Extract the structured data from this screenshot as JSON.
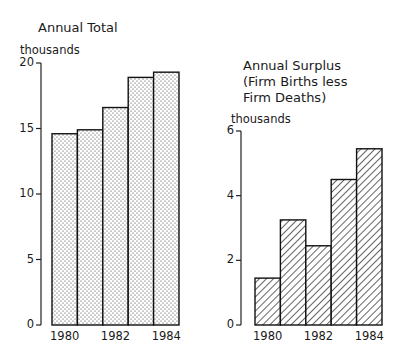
{
  "chart_data": [
    {
      "type": "bar",
      "title": "Annual Total",
      "ylabel": "thousands",
      "xlabel": "",
      "categories": [
        "1980",
        "1981",
        "1982",
        "1983",
        "1984"
      ],
      "values": [
        14.6,
        14.9,
        16.6,
        18.9,
        19.3
      ],
      "ylim": [
        0,
        20
      ],
      "yticks": [
        "0",
        "5",
        "10",
        "15",
        "20"
      ],
      "xtick_labels": [
        "1980",
        "1982",
        "1984"
      ],
      "fill": "dotted",
      "grid": false
    },
    {
      "type": "bar",
      "title": "Annual Surplus\n(Firm Births less\nFirm Deaths)",
      "ylabel": "thousands",
      "xlabel": "",
      "categories": [
        "1980",
        "1981",
        "1982",
        "1983",
        "1984"
      ],
      "values": [
        1.45,
        3.25,
        2.45,
        4.5,
        5.45
      ],
      "ylim": [
        0,
        6
      ],
      "yticks": [
        "0",
        "2",
        "4",
        "6"
      ],
      "xtick_labels": [
        "1980",
        "1982",
        "1984"
      ],
      "fill": "hatched",
      "grid": false
    }
  ],
  "left": {
    "title": "Annual Total",
    "unit": "thousands",
    "yticks": [
      "20",
      "15",
      "10",
      "5",
      "0"
    ],
    "xlabels": [
      "1980",
      "1982",
      "1984"
    ]
  },
  "right": {
    "title": "Annual Surplus\n(Firm Births less\nFirm Deaths)",
    "unit": "thousands",
    "yticks": [
      "6",
      "4",
      "2",
      "0"
    ],
    "xlabels": [
      "1980",
      "1982",
      "1984"
    ]
  }
}
